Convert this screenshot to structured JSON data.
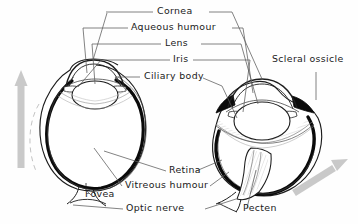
{
  "figure": {
    "background_color": "#fefefe",
    "ink_color": "#1a1a1a",
    "arrow_color": "#c8c8c8"
  },
  "labels": {
    "cornea": "Cornea",
    "aqueous_humour": "Aqueous humour",
    "lens": "Lens",
    "iris": "Iris",
    "ciliary_body": "Ciliary body",
    "scleral_ossicle": "Scleral ossicle",
    "retina": "Retina",
    "vitreous_humour": "Vitreous humour",
    "fovea": "Fovea",
    "optic_nerve": "Optic nerve",
    "pecten": "Pecten"
  },
  "diagrams": [
    {
      "name": "left-eye-section",
      "shape": "spherical",
      "features": [
        "cornea",
        "aqueous humour",
        "lens",
        "iris",
        "ciliary body",
        "retina",
        "vitreous humour",
        "fovea",
        "optic nerve"
      ],
      "axis_arrow": "up"
    },
    {
      "name": "right-eye-section",
      "shape": "flattened",
      "features": [
        "cornea",
        "aqueous humour",
        "lens",
        "iris",
        "ciliary body",
        "scleral ossicle",
        "retina",
        "vitreous humour",
        "optic nerve",
        "pecten"
      ],
      "axis_arrow": "up-right"
    }
  ]
}
